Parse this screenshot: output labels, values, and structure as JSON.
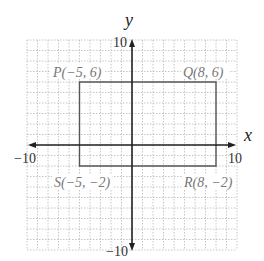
{
  "plane": {
    "x_range": [
      -10,
      10
    ],
    "y_range": [
      -10,
      10
    ],
    "axis_labels": {
      "x": "x",
      "y": "y"
    },
    "tick_labels": {
      "x_min": "−10",
      "x_max": "10",
      "y_min": "−10",
      "y_max": "10"
    },
    "grid": true
  },
  "rectangle": {
    "vertices": [
      {
        "name": "P",
        "label": "P(−5, 6)",
        "x": -5,
        "y": 6
      },
      {
        "name": "Q",
        "label": "Q(8, 6)",
        "x": 8,
        "y": 6
      },
      {
        "name": "R",
        "label": "R(8, −2)",
        "x": 8,
        "y": -2
      },
      {
        "name": "S",
        "label": "S(−5, −2)",
        "x": -5,
        "y": -2
      }
    ]
  },
  "colors": {
    "grid": "#b8b8b8",
    "axis": "#222222",
    "rectangle": "#555555",
    "vertex_label": "#777777",
    "tick_label": "#333333"
  }
}
